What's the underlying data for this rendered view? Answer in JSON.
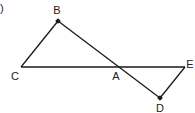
{
  "fragment": ")",
  "points": {
    "B": {
      "label": "B",
      "x": 58,
      "y": 21,
      "lx": 57,
      "ly": 14
    },
    "C": {
      "label": "C",
      "x": 21,
      "y": 67,
      "lx": 15,
      "ly": 80
    },
    "A": {
      "label": "A",
      "x": 116,
      "y": 67,
      "lx": 116,
      "ly": 80
    },
    "E": {
      "label": "E",
      "x": 185,
      "y": 67,
      "lx": 190,
      "ly": 68
    },
    "D": {
      "label": "D",
      "x": 160,
      "y": 98,
      "lx": 160,
      "ly": 112
    }
  },
  "segments": [
    [
      "C",
      "B"
    ],
    [
      "B",
      "D"
    ],
    [
      "C",
      "E"
    ],
    [
      "E",
      "D"
    ]
  ],
  "marked_points": [
    "B",
    "D"
  ],
  "colors": {
    "stroke": "#1a1a1a",
    "label": "#222222"
  }
}
